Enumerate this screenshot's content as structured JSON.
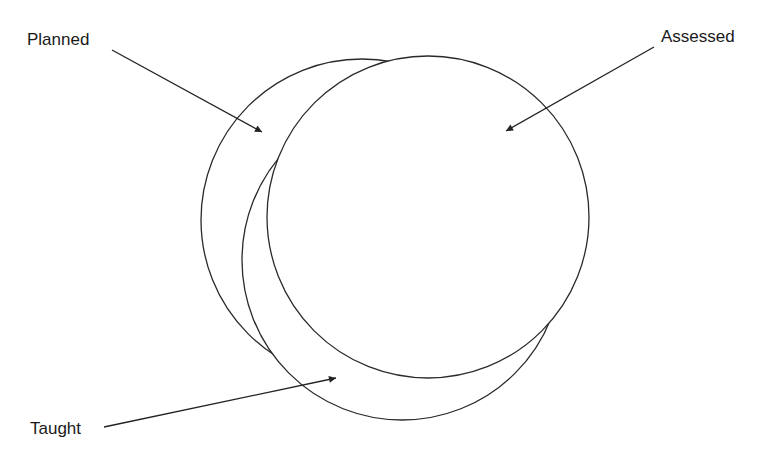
{
  "diagram": {
    "type": "overlapping-circles",
    "labels": {
      "planned": "Planned",
      "assessed": "Assessed",
      "taught": "Taught"
    },
    "colors": {
      "stroke": "#2a2a2a",
      "background": "#ffffff",
      "text": "#1a1a1a"
    }
  }
}
